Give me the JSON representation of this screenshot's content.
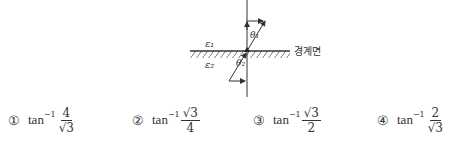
{
  "diagram": {
    "medium_1_label": "ε₁",
    "medium_2_label": "ε₂",
    "angle_1_label": "θ₁",
    "angle_2_label": "θ₂",
    "interface_label": "경계면"
  },
  "choices": [
    {
      "number": "①",
      "func": "tan",
      "exp": "−1",
      "numerator": "4",
      "denominator": "√3"
    },
    {
      "number": "②",
      "func": "tan",
      "exp": "−1",
      "numerator": "√3",
      "denominator": "4"
    },
    {
      "number": "③",
      "func": "tan",
      "exp": "−1",
      "numerator": "√3",
      "denominator": "2"
    },
    {
      "number": "④",
      "func": "tan",
      "exp": "−1",
      "numerator": "2",
      "denominator": "√3"
    }
  ]
}
